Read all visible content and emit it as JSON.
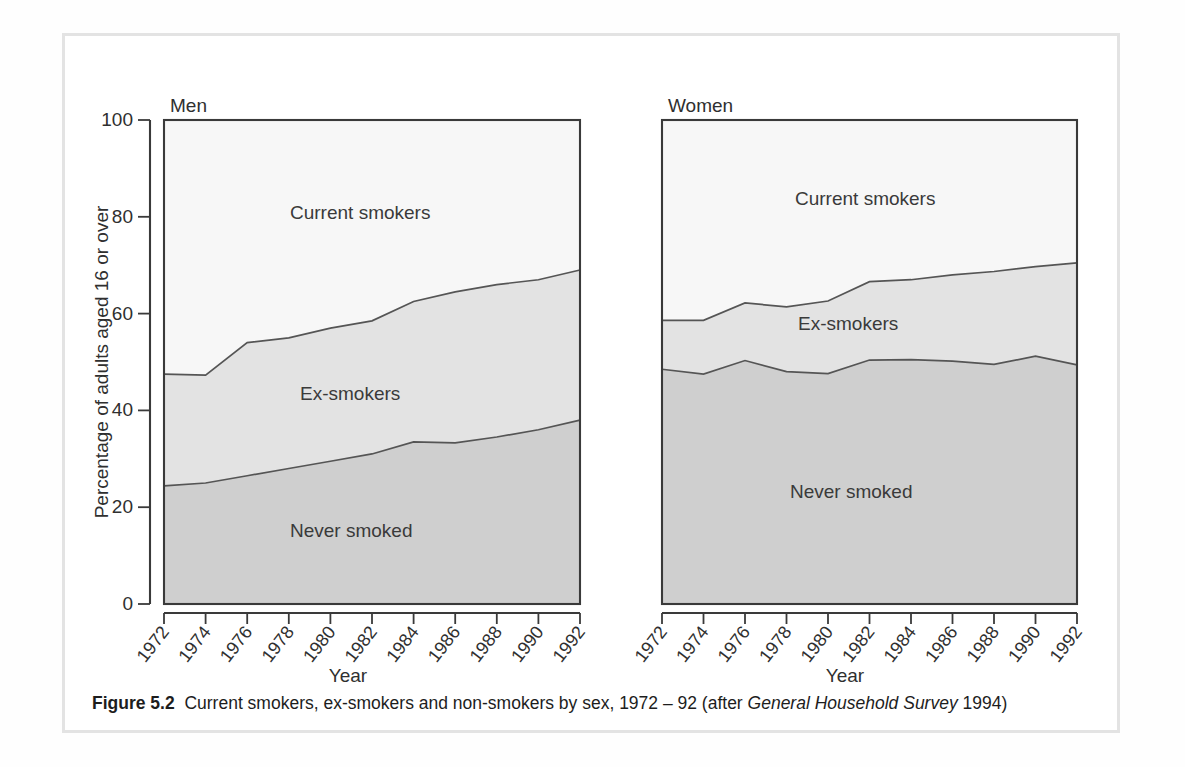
{
  "figure": {
    "caption_number": "Figure 5.2",
    "caption_text_1": "Current smokers, ex-smokers and non-smokers by sex, 1972 – 92 (after ",
    "caption_italic": "General Household Survey",
    "caption_text_2": " 1994)"
  },
  "chart_data": {
    "type": "area",
    "title": "Current smokers, ex-smokers and non-smokers by sex, 1972 – 92",
    "source": "General Household Survey 1994",
    "xlabel": "Year",
    "ylabel": "Percentage of adults aged 16 or over",
    "ylim": [
      0,
      100
    ],
    "yticks": [
      0,
      20,
      40,
      60,
      80,
      100
    ],
    "xlim": [
      1972,
      1992
    ],
    "grid": false,
    "legend_position": "inline-labels",
    "stacked": true,
    "x": [
      1972,
      1974,
      1976,
      1978,
      1980,
      1982,
      1984,
      1986,
      1988,
      1990,
      1992
    ],
    "panels": [
      {
        "name": "men",
        "title": "Men",
        "series": [
          {
            "name": "Never smoked",
            "order": 1,
            "color": "#cfcfcf",
            "values": [
              24.4,
              25.0,
              26.5,
              28.0,
              29.5,
              31.0,
              33.5,
              33.3,
              34.5,
              36.0,
              38.0
            ]
          },
          {
            "name": "Ex-smokers",
            "order": 2,
            "color": "#e3e3e3",
            "values": [
              23.1,
              22.3,
              27.5,
              27.0,
              27.5,
              27.5,
              29.0,
              31.2,
              31.5,
              31.0,
              31.0
            ]
          },
          {
            "name": "Current smokers",
            "order": 3,
            "color": "#f7f7f7",
            "values": [
              52.5,
              52.7,
              46.0,
              45.0,
              43.0,
              41.5,
              37.5,
              35.5,
              34.0,
              33.0,
              31.0
            ]
          }
        ],
        "cumulative_never": [
          24.4,
          25.0,
          26.5,
          28.0,
          29.5,
          31.0,
          33.5,
          33.3,
          34.5,
          36.0,
          38.0
        ],
        "cumulative_never_plus_ex": [
          47.5,
          47.3,
          54.0,
          55.0,
          57.0,
          58.5,
          62.5,
          64.5,
          66.0,
          67.0,
          69.0
        ]
      },
      {
        "name": "women",
        "title": "Women",
        "series": [
          {
            "name": "Never smoked",
            "order": 1,
            "color": "#cfcfcf",
            "values": [
              48.5,
              47.5,
              50.3,
              48.0,
              47.6,
              50.4,
              50.5,
              50.2,
              49.5,
              51.2,
              49.4
            ]
          },
          {
            "name": "Ex-smokers",
            "order": 2,
            "color": "#e3e3e3",
            "values": [
              10.1,
              11.1,
              11.9,
              13.4,
              15.0,
              16.2,
              16.5,
              17.8,
              19.2,
              18.5,
              21.1
            ]
          },
          {
            "name": "Current smokers",
            "order": 3,
            "color": "#f7f7f7",
            "values": [
              41.4,
              41.4,
              37.8,
              38.6,
              37.4,
              33.4,
              33.0,
              32.0,
              31.3,
              30.3,
              29.5
            ]
          }
        ],
        "cumulative_never": [
          48.5,
          47.5,
          50.3,
          48.0,
          47.6,
          50.4,
          50.5,
          50.2,
          49.5,
          51.2,
          49.4
        ],
        "cumulative_never_plus_ex": [
          58.6,
          58.6,
          62.2,
          61.4,
          62.6,
          66.6,
          67.0,
          68.0,
          68.7,
          69.7,
          70.5
        ]
      }
    ],
    "area_labels": {
      "current_smokers": "Current smokers",
      "ex_smokers": "Ex-smokers",
      "never_smoked": "Never smoked"
    },
    "xtick_labels": [
      "1972",
      "1974",
      "1976",
      "1978",
      "1980",
      "1982",
      "1984",
      "1986",
      "1988",
      "1990",
      "1992"
    ],
    "ytick_labels": [
      "0",
      "20",
      "40",
      "60",
      "80",
      "100"
    ]
  },
  "colors": {
    "band_current": "#f7f7f7",
    "band_ex": "#e3e3e3",
    "band_never": "#cfcfcf",
    "axis": "#3a3a3a",
    "line": "#555555",
    "page_frame": "#e3e3e3"
  }
}
